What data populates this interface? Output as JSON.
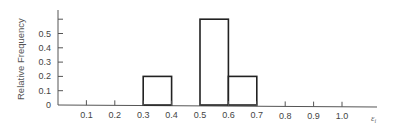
{
  "chart_data": {
    "type": "bar",
    "title": "",
    "xlabel": "ε_i",
    "ylabel": "Relative Frequency",
    "xlim": [
      0,
      1.1
    ],
    "ylim": [
      0,
      0.65
    ],
    "x_ticks": [
      "0.1",
      "0.2",
      "0.3",
      "0.4",
      "0.5",
      "0.6",
      "0.7",
      "0.8",
      "0.9",
      "1.0"
    ],
    "y_ticks": [
      "0",
      "0.1",
      "0.2",
      "0.3",
      "0.4",
      "0.5"
    ],
    "y_tick_unlabeled_top": 0.6,
    "grid": false,
    "legend": null,
    "bins": [
      {
        "x_start": 0.3,
        "x_end": 0.4,
        "value": 0.2
      },
      {
        "x_start": 0.5,
        "x_end": 0.6,
        "value": 0.6
      },
      {
        "x_start": 0.6,
        "x_end": 0.7,
        "value": 0.2
      }
    ],
    "categories": [
      "0.3–0.4",
      "0.5–0.6",
      "0.6–0.7"
    ],
    "values": [
      0.2,
      0.6,
      0.2
    ],
    "style": {
      "bar_fill": "#ffffff",
      "bar_stroke": "#222222",
      "axis_color": "#555555"
    }
  }
}
